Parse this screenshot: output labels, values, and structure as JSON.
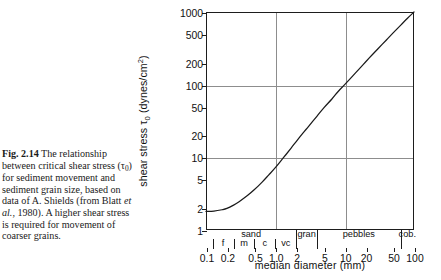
{
  "caption": {
    "figure_number": "Fig. 2.14",
    "text_part1": "The relationship between critical shear stress (",
    "tau_symbol": "τ",
    "tau_sub": "0",
    "text_part2": ") for sediment movement and sediment grain size, based on data of A. Shields (from Blatt ",
    "italic1": "et al.",
    "text_part3": ", 1980). A higher shear stress is required for movement of coarser grains."
  },
  "chart_data": {
    "type": "line",
    "title": "",
    "xlabel": "median diameter (mm)",
    "ylabel": "shear stress τ0 (dynes/cm2)",
    "ylabel_parts": {
      "prefix": "shear stress ",
      "tau": "τ",
      "tau_sub": "0",
      "units_open": " (dynes/cm",
      "units_sup": "2",
      "units_close": ")"
    },
    "xscale": "log",
    "yscale": "log",
    "xlim": [
      0.1,
      100
    ],
    "ylim": [
      1,
      1000
    ],
    "grid": true,
    "gridlines_x": [
      1,
      10
    ],
    "gridlines_y": [
      10,
      100
    ],
    "legend": "none",
    "xticks": [
      "0.1",
      "0.2",
      "0.5",
      "1.0",
      "2",
      "5",
      "10",
      "20",
      "50",
      "100"
    ],
    "xtick_values": [
      0.1,
      0.2,
      0.5,
      1.0,
      2,
      5,
      10,
      20,
      50,
      100
    ],
    "yticks": [
      "1",
      "2",
      "5",
      "10",
      "20",
      "50",
      "100",
      "200",
      "500",
      "1000"
    ],
    "ytick_values": [
      1,
      2,
      5,
      10,
      20,
      50,
      100,
      200,
      500,
      1000
    ],
    "series": [
      {
        "name": "critical shear stress",
        "x": [
          0.1,
          0.13,
          0.17,
          0.2,
          0.25,
          0.3,
          0.4,
          0.5,
          0.65,
          0.8,
          1.0,
          1.3,
          1.7,
          2.0,
          2.5,
          3.0,
          4.0,
          5.0,
          6.5,
          8.0,
          10.0,
          13.0,
          17.0,
          20.0,
          25.0,
          30.0,
          40.0,
          50.0,
          65.0,
          80.0,
          100.0
        ],
        "y": [
          1.8,
          1.82,
          1.9,
          1.98,
          2.2,
          2.45,
          3.0,
          3.6,
          4.6,
          5.7,
          7.2,
          9.8,
          13.5,
          16.5,
          21.5,
          26.5,
          37.0,
          48.0,
          63.0,
          80.0,
          100.0,
          131.0,
          173.0,
          205.0,
          258.0,
          310.0,
          412.0,
          515.0,
          665.0,
          815.0,
          1000.0
        ]
      }
    ],
    "grain_classes": {
      "major": [
        {
          "label": "sand",
          "from": 0.0625,
          "to": 2.0
        },
        {
          "label": "gran",
          "from": 2.0,
          "to": 4.0
        },
        {
          "label": "pebbles",
          "from": 4.0,
          "to": 64.0
        },
        {
          "label": "cob.",
          "from": 64.0,
          "to": 256.0
        }
      ],
      "minor": [
        {
          "label": "f",
          "from": 0.125,
          "to": 0.25
        },
        {
          "label": "m",
          "from": 0.25,
          "to": 0.5
        },
        {
          "label": "c",
          "from": 0.5,
          "to": 1.0
        },
        {
          "label": "vc",
          "from": 1.0,
          "to": 2.0
        }
      ]
    }
  },
  "colors": {
    "curve": "#1a1a1a",
    "axis": "#1d1d1d",
    "grid": "#8d8d8d",
    "text": "#111111",
    "background": "#ffffff"
  }
}
